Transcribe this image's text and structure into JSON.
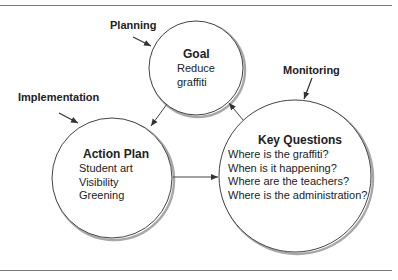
{
  "diagram": {
    "stage_labels": {
      "planning": "Planning",
      "implementation": "Implementation",
      "monitoring": "Monitoring"
    },
    "nodes": {
      "goal": {
        "title": "Goal",
        "lines": [
          "Reduce",
          "graffiti"
        ]
      },
      "action_plan": {
        "title": "Action Plan",
        "lines": [
          "Student art",
          "Visibility",
          "Greening"
        ]
      },
      "key_questions": {
        "title": "Key Questions",
        "lines": [
          "Where is the graffiti?",
          "When is it happening?",
          "Where are the teachers?",
          "Where is the administration?"
        ]
      }
    },
    "edges": [
      {
        "from": "goal",
        "to": "action_plan"
      },
      {
        "from": "action_plan",
        "to": "key_questions"
      },
      {
        "from": "key_questions",
        "to": "goal"
      }
    ],
    "colors": {
      "stroke": "#444444",
      "shadow": "#9a9a9a",
      "rule": "#777777",
      "text": "#222222"
    }
  }
}
